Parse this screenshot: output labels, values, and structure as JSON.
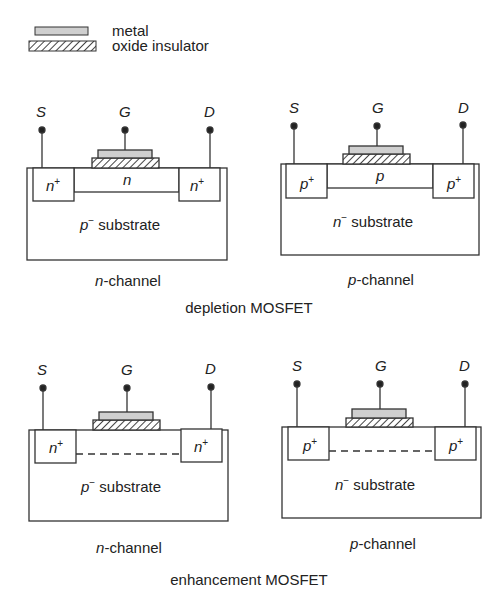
{
  "legend": {
    "items": [
      {
        "swatch": "metal-swatch",
        "label": "metal"
      },
      {
        "swatch": "oxide-hatch-swatch",
        "label": "oxide insulator"
      }
    ]
  },
  "terminals": {
    "source": "S",
    "gate": "G",
    "drain": "D"
  },
  "devices": [
    {
      "group": "depletion",
      "caption": "n-channel",
      "caption_italic": "n",
      "caption_rest": "-channel",
      "well_base": "n",
      "well_sup": "+",
      "channel": "n",
      "substrate_base": "p",
      "substrate_sup": "−",
      "substrate_rest": " substrate",
      "channel_type": "solid"
    },
    {
      "group": "depletion",
      "caption": "p-channel",
      "caption_italic": "p",
      "caption_rest": "-channel",
      "well_base": "p",
      "well_sup": "+",
      "channel": "p",
      "substrate_base": "n",
      "substrate_sup": "−",
      "substrate_rest": " substrate",
      "channel_type": "solid"
    },
    {
      "group": "enhancement",
      "caption": "n-channel",
      "caption_italic": "n",
      "caption_rest": "-channel",
      "well_base": "n",
      "well_sup": "+",
      "channel": "",
      "substrate_base": "p",
      "substrate_sup": "−",
      "substrate_rest": " substrate",
      "channel_type": "dashed"
    },
    {
      "group": "enhancement",
      "caption": "p-channel",
      "caption_italic": "p",
      "caption_rest": "-channel",
      "well_base": "p",
      "well_sup": "+",
      "channel": "",
      "substrate_base": "n",
      "substrate_sup": "−",
      "substrate_rest": " substrate",
      "channel_type": "dashed"
    }
  ],
  "group_titles": {
    "depletion": "depletion MOSFET",
    "enhancement": "enhancement MOSFET"
  },
  "colors": {
    "line": "#333333",
    "metal_fill": "#cfcfcf",
    "hatch": "#444444",
    "background": "#ffffff"
  }
}
